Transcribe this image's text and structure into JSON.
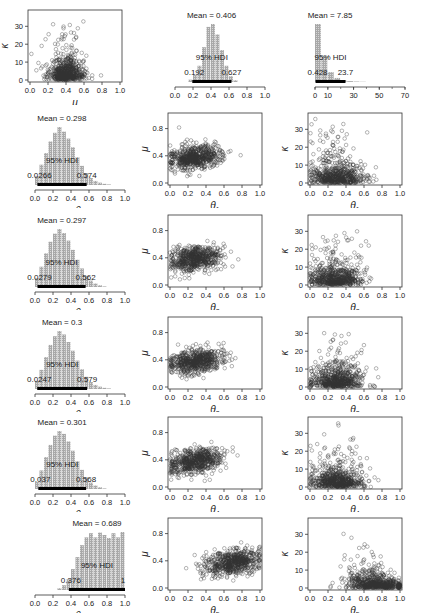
{
  "figure": {
    "rows": 6,
    "cols": 3,
    "width": 422,
    "height": 616
  },
  "colors": {
    "bar_fill": "#a8a8a8",
    "bar_hatch": "#d6d6d6",
    "hdi_bar": "#000000",
    "point_stroke": "#333333",
    "axis": "#333333"
  },
  "chart_data": [
    {
      "type": "scatter",
      "row": 0,
      "col": 0,
      "xlabel": "μ",
      "ylabel": "κ",
      "xlim": [
        0,
        1
      ],
      "ylim": [
        0,
        38
      ],
      "xticks": [
        "0.0",
        "0.2",
        "0.4",
        "0.6",
        "0.8",
        "1.0"
      ],
      "yticks": [
        "0",
        "10",
        "20",
        "30"
      ],
      "cloud": {
        "cx": 0.4,
        "cy": 4,
        "sx": 0.1,
        "sy": 5,
        "spread_up": 0.07,
        "n": 600
      }
    },
    {
      "type": "bar",
      "row": 0,
      "col": 1,
      "xlabel": "μ",
      "xlim": [
        0,
        1
      ],
      "xticks": [
        "0.0",
        "0.2",
        "0.4",
        "0.6",
        "0.8",
        "1.0"
      ],
      "mean_label": "Mean = 0.406",
      "hdi_label": "95% HDI",
      "hdi_low": "0.192",
      "hdi_high": "0.627",
      "hdi": [
        0.192,
        0.627
      ],
      "bins": [
        0.15,
        0.2,
        0.25,
        0.3,
        0.35,
        0.4,
        0.45,
        0.5,
        0.55,
        0.6,
        0.65
      ],
      "values": [
        4,
        12,
        28,
        60,
        95,
        100,
        82,
        55,
        28,
        10,
        3
      ]
    },
    {
      "type": "bar",
      "row": 0,
      "col": 2,
      "xlabel": "κ",
      "xlim": [
        0,
        70
      ],
      "xticks": [
        "0",
        "10",
        "30",
        "50",
        "70"
      ],
      "xtick_vals": [
        0,
        10,
        30,
        50,
        70
      ],
      "mean_label": "Mean = 7.85",
      "hdi_label": "95% HDI",
      "hdi_low": "0.428",
      "hdi_high": "23.7",
      "hdi": [
        0.428,
        23.7
      ],
      "bins": [
        0,
        5,
        10,
        15,
        20,
        25,
        30,
        35
      ],
      "values": [
        100,
        45,
        17,
        7,
        3,
        1.5,
        0.8,
        0.4
      ]
    },
    {
      "type": "bar",
      "row": 1,
      "col": 0,
      "xlabel": "θ1",
      "xlim": [
        0,
        1
      ],
      "xticks": [
        "0.0",
        "0.2",
        "0.4",
        "0.6",
        "0.8",
        "1.0"
      ],
      "mean_label": "Mean = 0.298",
      "hdi_label": "95% HDI",
      "hdi_low": "0.0266",
      "hdi_high": "0.574",
      "hdi": [
        0.0266,
        0.574
      ],
      "bins": [
        0,
        0.05,
        0.1,
        0.15,
        0.2,
        0.25,
        0.3,
        0.35,
        0.4,
        0.45,
        0.5,
        0.55,
        0.6,
        0.65,
        0.7,
        0.75,
        0.8
      ],
      "values": [
        15,
        35,
        55,
        75,
        90,
        100,
        92,
        80,
        65,
        48,
        33,
        20,
        12,
        7,
        4,
        2,
        1
      ]
    },
    {
      "type": "scatter",
      "row": 1,
      "col": 1,
      "xlabel": "θ1",
      "ylabel": "μ",
      "xlim": [
        0,
        1
      ],
      "ylim": [
        0,
        1
      ],
      "xticks": [
        "0.0",
        "0.2",
        "0.4",
        "0.6",
        "0.8",
        "1.0"
      ],
      "yticks": [
        "0.0",
        "0.4",
        "0.8"
      ],
      "ytick_vals": [
        0,
        0.4,
        0.8
      ],
      "cloud": {
        "cx": 0.28,
        "cy": 0.38,
        "sx": 0.14,
        "sy": 0.09,
        "corr": 0.35,
        "n": 600
      }
    },
    {
      "type": "scatter",
      "row": 1,
      "col": 2,
      "xlabel": "θ1",
      "ylabel": "κ",
      "xlim": [
        0,
        1
      ],
      "ylim": [
        0,
        38
      ],
      "xticks": [
        "0.0",
        "0.2",
        "0.4",
        "0.6",
        "0.8",
        "1.0"
      ],
      "yticks": [
        "0",
        "10",
        "20",
        "30"
      ],
      "cloud": {
        "cx": 0.3,
        "cy": 4,
        "sx": 0.15,
        "sy": 5,
        "spread_up": 0.06,
        "n": 600
      }
    },
    {
      "type": "bar",
      "row": 2,
      "col": 0,
      "xlabel": "θ2",
      "xlim": [
        0,
        1
      ],
      "xticks": [
        "0.0",
        "0.2",
        "0.4",
        "0.6",
        "0.8",
        "1.0"
      ],
      "mean_label": "Mean = 0.297",
      "hdi_label": "95% HDI",
      "hdi_low": "0.0279",
      "hdi_high": "0.562",
      "hdi": [
        0.0279,
        0.562
      ],
      "bins": [
        0,
        0.05,
        0.1,
        0.15,
        0.2,
        0.25,
        0.3,
        0.35,
        0.4,
        0.45,
        0.5,
        0.55,
        0.6,
        0.65,
        0.7,
        0.75
      ],
      "values": [
        15,
        35,
        58,
        78,
        92,
        100,
        93,
        80,
        64,
        47,
        32,
        19,
        11,
        6,
        3,
        1
      ]
    },
    {
      "type": "scatter",
      "row": 2,
      "col": 1,
      "xlabel": "θ2",
      "ylabel": "μ",
      "xlim": [
        0,
        1
      ],
      "ylim": [
        0,
        1
      ],
      "xticks": [
        "0.0",
        "0.2",
        "0.4",
        "0.6",
        "0.8",
        "1.0"
      ],
      "yticks": [
        "0.0",
        "0.4",
        "0.8"
      ],
      "ytick_vals": [
        0,
        0.4,
        0.8
      ],
      "cloud": {
        "cx": 0.28,
        "cy": 0.38,
        "sx": 0.14,
        "sy": 0.09,
        "corr": 0.35,
        "n": 600
      }
    },
    {
      "type": "scatter",
      "row": 2,
      "col": 2,
      "xlabel": "θ2",
      "ylabel": "κ",
      "xlim": [
        0,
        1
      ],
      "ylim": [
        0,
        38
      ],
      "xticks": [
        "0.0",
        "0.2",
        "0.4",
        "0.6",
        "0.8",
        "1.0"
      ],
      "yticks": [
        "0",
        "10",
        "20",
        "30"
      ],
      "cloud": {
        "cx": 0.3,
        "cy": 4,
        "sx": 0.15,
        "sy": 5,
        "spread_up": 0.06,
        "n": 600
      }
    },
    {
      "type": "bar",
      "row": 3,
      "col": 0,
      "xlabel": "θ3",
      "xlim": [
        0,
        1
      ],
      "xticks": [
        "0.0",
        "0.2",
        "0.4",
        "0.6",
        "0.8",
        "1.0"
      ],
      "mean_label": "Mean = 0.3",
      "hdi_label": "95% HDI",
      "hdi_low": "0.0247",
      "hdi_high": "0.579",
      "hdi": [
        0.0247,
        0.579
      ],
      "bins": [
        0,
        0.05,
        0.1,
        0.15,
        0.2,
        0.25,
        0.3,
        0.35,
        0.4,
        0.45,
        0.5,
        0.55,
        0.6,
        0.65,
        0.7,
        0.75,
        0.8
      ],
      "values": [
        14,
        33,
        55,
        76,
        91,
        100,
        94,
        81,
        66,
        49,
        34,
        21,
        12,
        7,
        4,
        2,
        1
      ]
    },
    {
      "type": "scatter",
      "row": 3,
      "col": 1,
      "xlabel": "θ3",
      "ylabel": "μ",
      "xlim": [
        0,
        1
      ],
      "ylim": [
        0,
        1
      ],
      "xticks": [
        "0.0",
        "0.2",
        "0.4",
        "0.6",
        "0.8",
        "1.0"
      ],
      "yticks": [
        "0.0",
        "0.4",
        "0.8"
      ],
      "ytick_vals": [
        0,
        0.4,
        0.8
      ],
      "cloud": {
        "cx": 0.29,
        "cy": 0.38,
        "sx": 0.15,
        "sy": 0.09,
        "corr": 0.35,
        "n": 600
      }
    },
    {
      "type": "scatter",
      "row": 3,
      "col": 2,
      "xlabel": "θ3",
      "ylabel": "κ",
      "xlim": [
        0,
        1
      ],
      "ylim": [
        0,
        38
      ],
      "xticks": [
        "0.0",
        "0.2",
        "0.4",
        "0.6",
        "0.8",
        "1.0"
      ],
      "yticks": [
        "0",
        "10",
        "20",
        "30"
      ],
      "cloud": {
        "cx": 0.3,
        "cy": 4,
        "sx": 0.15,
        "sy": 5,
        "spread_up": 0.06,
        "n": 600
      }
    },
    {
      "type": "bar",
      "row": 4,
      "col": 0,
      "xlabel": "θ4",
      "xlim": [
        0,
        1
      ],
      "xticks": [
        "0.0",
        "0.2",
        "0.4",
        "0.6",
        "0.8",
        "1.0"
      ],
      "mean_label": "Mean = 0.301",
      "hdi_label": "95% HDI",
      "hdi_low": "0.037",
      "hdi_high": "0.568",
      "hdi": [
        0.037,
        0.568
      ],
      "bins": [
        0,
        0.05,
        0.1,
        0.15,
        0.2,
        0.25,
        0.3,
        0.35,
        0.4,
        0.45,
        0.5,
        0.55,
        0.6,
        0.65,
        0.7,
        0.75
      ],
      "values": [
        12,
        32,
        55,
        76,
        92,
        100,
        95,
        82,
        66,
        48,
        33,
        20,
        11,
        6,
        3,
        1
      ]
    },
    {
      "type": "scatter",
      "row": 4,
      "col": 1,
      "xlabel": "θ4",
      "ylabel": "μ",
      "xlim": [
        0,
        1
      ],
      "ylim": [
        0,
        1
      ],
      "xticks": [
        "0.0",
        "0.2",
        "0.4",
        "0.6",
        "0.8",
        "1.0"
      ],
      "yticks": [
        "0.0",
        "0.4",
        "0.8"
      ],
      "ytick_vals": [
        0,
        0.4,
        0.8
      ],
      "cloud": {
        "cx": 0.29,
        "cy": 0.38,
        "sx": 0.15,
        "sy": 0.09,
        "corr": 0.35,
        "n": 600
      }
    },
    {
      "type": "scatter",
      "row": 4,
      "col": 2,
      "xlabel": "θ4",
      "ylabel": "κ",
      "xlim": [
        0,
        1
      ],
      "ylim": [
        0,
        38
      ],
      "xticks": [
        "0.0",
        "0.2",
        "0.4",
        "0.6",
        "0.8",
        "1.0"
      ],
      "yticks": [
        "0",
        "10",
        "20",
        "30"
      ],
      "cloud": {
        "cx": 0.3,
        "cy": 4,
        "sx": 0.15,
        "sy": 5,
        "spread_up": 0.06,
        "n": 600
      }
    },
    {
      "type": "bar",
      "row": 5,
      "col": 0,
      "xlabel": "θ5",
      "xlim": [
        0,
        1
      ],
      "xticks": [
        "0.0",
        "0.2",
        "0.4",
        "0.6",
        "0.8",
        "1.0"
      ],
      "mean_label": "Mean = 0.689",
      "hdi_label": "95% HDI",
      "hdi_low": "0.376",
      "hdi_high": "1",
      "hdi": [
        0.376,
        1.0
      ],
      "bins": [
        0.25,
        0.3,
        0.35,
        0.4,
        0.45,
        0.5,
        0.55,
        0.6,
        0.65,
        0.7,
        0.75,
        0.8,
        0.85,
        0.9,
        0.95
      ],
      "values": [
        3,
        8,
        18,
        35,
        55,
        75,
        88,
        95,
        88,
        96,
        92,
        87,
        95,
        88,
        97
      ]
    },
    {
      "type": "scatter",
      "row": 5,
      "col": 1,
      "xlabel": "θ5",
      "ylabel": "μ",
      "xlim": [
        0,
        1
      ],
      "ylim": [
        0,
        1
      ],
      "xticks": [
        "0.0",
        "0.2",
        "0.4",
        "0.6",
        "0.8",
        "1.0"
      ],
      "yticks": [
        "0.0",
        "0.4",
        "0.8"
      ],
      "ytick_vals": [
        0,
        0.4,
        0.8
      ],
      "cloud": {
        "cx": 0.7,
        "cy": 0.38,
        "sx": 0.16,
        "sy": 0.09,
        "corr": 0.4,
        "xmax": 1.0,
        "n": 600
      }
    },
    {
      "type": "scatter",
      "row": 5,
      "col": 2,
      "xlabel": "θ5",
      "ylabel": "κ",
      "xlim": [
        0,
        1
      ],
      "ylim": [
        0,
        38
      ],
      "xticks": [
        "0.0",
        "0.2",
        "0.4",
        "0.6",
        "0.8",
        "1.0"
      ],
      "yticks": [
        "0",
        "10",
        "20",
        "30"
      ],
      "cloud": {
        "cx": 0.72,
        "cy": 4,
        "sx": 0.16,
        "sy": 5,
        "spread_up": 0.06,
        "neg": true,
        "xmax": 1.0,
        "n": 600
      }
    }
  ]
}
